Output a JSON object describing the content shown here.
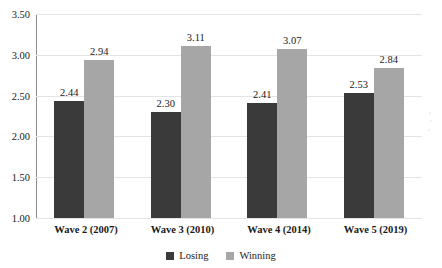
{
  "chart_data": {
    "type": "bar",
    "title": "",
    "xlabel": "",
    "ylabel": "",
    "categories": [
      "Wave 2 (2007)",
      "Wave 3 (2010)",
      "Wave 4 (2014)",
      "Wave 5 (2019)"
    ],
    "series": [
      {
        "name": "Losing",
        "color": "#3a3a3a",
        "values": [
          2.44,
          2.3,
          2.41,
          2.53
        ]
      },
      {
        "name": "Winning",
        "color": "#a6a6a6",
        "values": [
          2.94,
          3.11,
          3.07,
          2.84
        ]
      }
    ],
    "ylim": [
      1.0,
      3.5
    ],
    "ytick_step": 0.5,
    "ytick_labels": [
      "3.50",
      "3.00",
      "2.50",
      "2.00",
      "1.50",
      "1.00"
    ],
    "ytick_values": [
      3.5,
      3.0,
      2.5,
      2.0,
      1.5,
      1.0
    ],
    "data_labels": [
      [
        "2.44",
        "2.94"
      ],
      [
        "2.30",
        "3.11"
      ],
      [
        "2.41",
        "3.07"
      ],
      [
        "2.53",
        "2.84"
      ]
    ],
    "grid": true,
    "legend_position": "bottom-center"
  },
  "legend": {
    "items": [
      {
        "label": "Losing"
      },
      {
        "label": "Winning"
      }
    ]
  },
  "title_remnant": ""
}
